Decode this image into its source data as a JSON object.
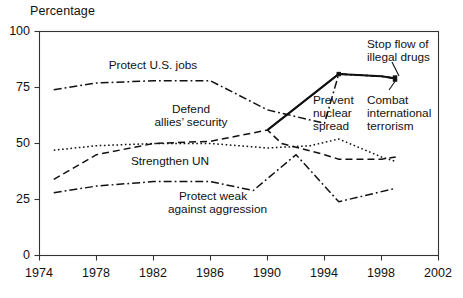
{
  "chart_data": {
    "type": "line",
    "title": "",
    "ylabel": "Percentage",
    "xlabel": "",
    "ylim": [
      0,
      100
    ],
    "xlim": [
      1974,
      2002
    ],
    "yticks": [
      0,
      25,
      50,
      75,
      100
    ],
    "xticks": [
      1974,
      1978,
      1982,
      1986,
      1990,
      1994,
      1998,
      2002
    ],
    "grid": false,
    "legend": "inline-annotations",
    "series": [
      {
        "name": "Protect U.S. jobs",
        "style": "dash-dot",
        "x": [
          1975,
          1978,
          1982,
          1986,
          1990,
          1994,
          1995,
          1998,
          1999
        ],
        "values": [
          74,
          77,
          78,
          78,
          65,
          59,
          81,
          80,
          79
        ]
      },
      {
        "name": "Combat international terrorism",
        "style": "solid",
        "x": [
          1990,
          1995,
          1998,
          1999
        ],
        "values": [
          56,
          81,
          80,
          79
        ]
      },
      {
        "name": "Stop flow of illegal drugs",
        "style": "dash-dot",
        "x": [
          1995,
          1998,
          1999
        ],
        "values": [
          81,
          80,
          79
        ]
      },
      {
        "name": "Prevent nuclear spread",
        "style": "solid",
        "x": [
          1990,
          1995
        ],
        "values": [
          56,
          81
        ]
      },
      {
        "name": "Defend allies' security",
        "style": "dashed",
        "x": [
          1975,
          1978,
          1982,
          1986,
          1990,
          1991,
          1994,
          1995,
          1998,
          1999
        ],
        "values": [
          34,
          45,
          50,
          51,
          56,
          50,
          45,
          43,
          43,
          44
        ]
      },
      {
        "name": "Strengthen UN",
        "style": "dotted",
        "x": [
          1975,
          1978,
          1982,
          1986,
          1990,
          1993,
          1995,
          1998,
          1999
        ],
        "values": [
          47,
          49,
          50,
          50,
          48,
          49,
          52,
          44,
          42
        ]
      },
      {
        "name": "Protect weak against aggression",
        "style": "dash-dot",
        "x": [
          1975,
          1978,
          1982,
          1986,
          1989,
          1992,
          1995,
          1999
        ],
        "values": [
          28,
          31,
          33,
          33,
          29,
          45,
          24,
          30
        ]
      }
    ],
    "annotations": [
      {
        "text": "Protect U.S. jobs",
        "x": 1979.8,
        "y": 83.5
      },
      {
        "text": "Defend",
        "x": 1984.6,
        "y": 70.5
      },
      {
        "text": "allies’ security",
        "x": 1985.5,
        "y": 65.0
      },
      {
        "text": "Strengthen UN",
        "x": 1983.4,
        "y": 43.0
      },
      {
        "text": "Protect weak",
        "x": 1990.0,
        "y": 27.5
      },
      {
        "text": "against aggression",
        "x": 1990.6,
        "y": 22.5
      },
      {
        "text": "Prevent",
        "x": 1995.3,
        "y": 63.0
      },
      {
        "text": "nuclear",
        "x": 1995.3,
        "y": 57.5
      },
      {
        "text": "spread",
        "x": 1995.3,
        "y": 52.0
      },
      {
        "text": "Stop flow of",
        "x": 1998.6,
        "y": 95.0
      },
      {
        "text": "illegal drugs",
        "x": 1998.6,
        "y": 89.5
      },
      {
        "text": "Combat",
        "x": 1998.3,
        "y": 63.0
      },
      {
        "text": "international",
        "x": 1998.3,
        "y": 57.5
      },
      {
        "text": "terrorism",
        "x": 1998.3,
        "y": 52.0
      }
    ],
    "colors": {
      "line": "#111111",
      "axis": "#333333",
      "background": "#ffffff"
    }
  },
  "axis": {
    "y_title": "Percentage",
    "y_ticks": [
      "100",
      "75",
      "50",
      "25",
      "0"
    ],
    "x_ticks": [
      "1974",
      "1978",
      "1982",
      "1986",
      "1990",
      "1994",
      "1998",
      "2002"
    ]
  },
  "labels": {
    "protect_us_jobs": "Protect U.S. jobs",
    "defend_line1": "Defend",
    "defend_line2": "allies’ security",
    "strengthen_un": "Strengthen UN",
    "protect_weak_line1": "Protect weak",
    "protect_weak_line2": "against aggression",
    "prevent_line1": "Prevent",
    "prevent_line2": "nuclear",
    "prevent_line3": "spread",
    "stop_flow_line1": "Stop flow of",
    "stop_flow_line2": "illegal drugs",
    "combat_line1": "Combat",
    "combat_line2": "international",
    "combat_line3": "terrorism"
  }
}
